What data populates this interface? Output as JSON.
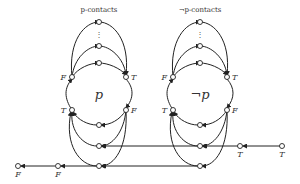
{
  "diagram": {
    "left_cluster": {
      "title": "p-contacts",
      "center_label": "p",
      "labels": {
        "upper_left": "F",
        "upper_right": "T",
        "lower_left": "T",
        "lower_right": "F"
      },
      "ellipsis": "⋮"
    },
    "right_cluster": {
      "title": "¬p-contacts",
      "center_label": "¬p",
      "labels": {
        "upper_left": "F",
        "upper_right": "T",
        "lower_left": "T",
        "lower_right": "F"
      },
      "ellipsis": "⋮"
    },
    "bottom_left_chain": {
      "labels": [
        "F",
        "F"
      ]
    },
    "right_chain": {
      "labels": [
        "T",
        "T"
      ]
    },
    "colors": {
      "stroke": "#222222",
      "node_fill": "#ffffff",
      "text": "#333333"
    }
  }
}
